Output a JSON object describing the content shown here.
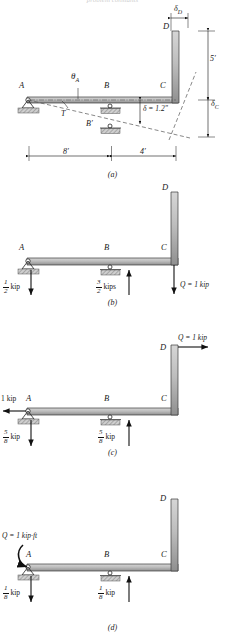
{
  "page": {
    "top_cut_text": "problem constants",
    "figures": [
      {
        "caption": "(a)",
        "labels": {
          "A": "A",
          "B": "B",
          "C": "C",
          "D": "D",
          "Bprime": "B′",
          "theta_A": "θ",
          "theta_A_sub": "A",
          "T": "T",
          "delta_D": "δ",
          "delta_D_sub": "D",
          "delta_C": "δ",
          "delta_C_sub": "C",
          "delta_value": "δ = 1.2\"",
          "height": "5′",
          "span_AB": "8′",
          "span_BC": "4′"
        }
      },
      {
        "caption": "(b)",
        "labels": {
          "A": "A",
          "B": "B",
          "C": "C",
          "D": "D"
        },
        "forces": [
          {
            "name": "reaction-A",
            "num": "1",
            "den": "2",
            "unit": "kip",
            "dir": "down"
          },
          {
            "name": "reaction-B",
            "num": "3",
            "den": "2",
            "unit": "kips",
            "dir": "up"
          },
          {
            "name": "load-Q",
            "text": "Q = 1 kip",
            "dir": "down"
          }
        ]
      },
      {
        "caption": "(c)",
        "labels": {
          "A": "A",
          "B": "B",
          "C": "C",
          "D": "D"
        },
        "forces": [
          {
            "name": "load-Q",
            "text": "Q = 1 kip",
            "dir": "right"
          },
          {
            "name": "reaction-A-horizontal",
            "text": "1 kip",
            "dir": "left"
          },
          {
            "name": "reaction-A",
            "num": "5",
            "den": "8",
            "unit": "kip",
            "dir": "down"
          },
          {
            "name": "reaction-B",
            "num": "5",
            "den": "8",
            "unit": "kip",
            "dir": "up"
          }
        ]
      },
      {
        "caption": "(d)",
        "labels": {
          "A": "A",
          "B": "B",
          "C": "C",
          "D": "D"
        },
        "forces": [
          {
            "name": "load-Q-moment",
            "text": "Q = 1 kip·ft",
            "dir": "moment"
          },
          {
            "name": "reaction-A",
            "num": "1",
            "den": "8",
            "unit": "kip",
            "dir": "down"
          },
          {
            "name": "reaction-B",
            "num": "1",
            "den": "8",
            "unit": "kip",
            "dir": "up"
          }
        ]
      }
    ]
  },
  "colors": {
    "member_fill": "#b8b8b8",
    "member_stroke": "#3a3a3a",
    "hatch": "#9a9a9a",
    "line": "#111111",
    "dashed": "#555555"
  }
}
